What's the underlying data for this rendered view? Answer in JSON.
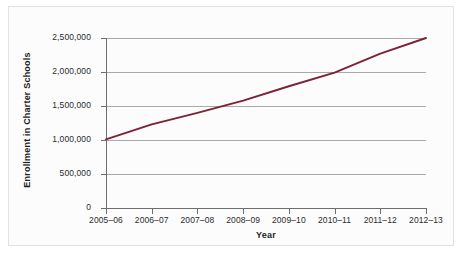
{
  "chart_data": {
    "type": "line",
    "title": "",
    "xlabel": "Year",
    "ylabel": "Enrollment in Charter Schools",
    "categories": [
      "2005–06",
      "2006–07",
      "2007–08",
      "2008–09",
      "2009–10",
      "2010–11",
      "2011–12",
      "2012–13"
    ],
    "values": [
      1010000,
      1230000,
      1400000,
      1580000,
      1790000,
      1990000,
      2270000,
      2500000
    ],
    "series": [
      {
        "name": "Enrollment in Charter Schools",
        "values": [
          1010000,
          1230000,
          1400000,
          1580000,
          1790000,
          1990000,
          2270000,
          2500000
        ]
      }
    ],
    "ytick_labels": [
      "0",
      "500,000",
      "1,000,000",
      "1,500,000",
      "2,000,000",
      "2,500,000"
    ],
    "ytick_values": [
      0,
      500000,
      1000000,
      1500000,
      2000000,
      2500000
    ],
    "ylim": [
      0,
      2500000
    ],
    "grid": "horizontal",
    "legend": "none",
    "line_color": "#7c2234",
    "gridline_color": "#a9a9a9",
    "axis_color": "#6e6e6e",
    "plot_background": "#fcfcfc"
  },
  "axes": {
    "y_title": "Enrollment in Charter Schools",
    "x_title": "Year"
  }
}
